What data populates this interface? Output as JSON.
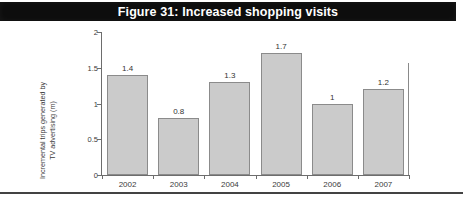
{
  "figure": {
    "title": "Figure 31: Increased shopping visits",
    "banner_color": "#0d0d0d",
    "banner_text_color": "#ffffff"
  },
  "chart_data": {
    "type": "bar",
    "title": "Figure 31: Increased shopping visits",
    "categories": [
      "2002",
      "2003",
      "2004",
      "2005",
      "2006",
      "2007"
    ],
    "values": [
      1.4,
      0.8,
      1.3,
      1.7,
      1,
      1.2
    ],
    "value_labels": [
      "1.4",
      "0.8",
      "1.3",
      "1.7",
      "1",
      "1.2"
    ],
    "xlabel": "",
    "ylabel_line1": "Incremental trips generated by",
    "ylabel_line2": "TV advertising (m)",
    "ylim": [
      0,
      2
    ],
    "yticks": [
      0,
      0.5,
      1,
      1.5,
      2
    ],
    "ytick_labels": [
      "0",
      "0.5",
      "1",
      "1.5",
      "2"
    ],
    "grid": false,
    "legend": false,
    "bar_fill_color": "#cbcbcb",
    "bar_border_color": "#8b8b8b",
    "axis_color": "#6d6d6d"
  }
}
